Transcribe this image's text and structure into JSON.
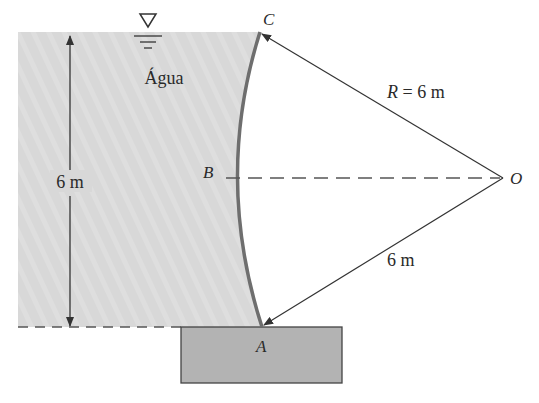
{
  "diagram": {
    "fluid_label": "Água",
    "height_label": "6 m",
    "radius_label_var": "R",
    "radius_label_eq": " = 6 m",
    "lower_radius_label": "6 m",
    "points": {
      "A": "A",
      "B": "B",
      "C": "C",
      "O": "O"
    },
    "colors": {
      "water": "#d9d9d9",
      "block": "#b3b3b3",
      "gate": "#6e6e6e",
      "line": "#333333"
    }
  }
}
